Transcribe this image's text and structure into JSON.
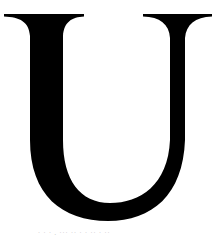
{
  "image": {
    "subject": "Serif capital letter",
    "letter": "U",
    "letter_color": "#000000",
    "background_color": "#ffffff"
  },
  "caption": {
    "text": "· · ·  .  ··· ··  ·  ·  ··  ·  ··",
    "color": "#b8b8b8"
  }
}
